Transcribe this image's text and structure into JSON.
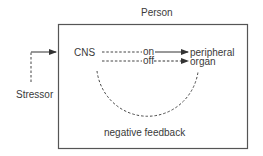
{
  "diagram": {
    "container_label": "Person",
    "input_label": "Stressor",
    "controller_label": "CNS",
    "on_label": "on",
    "off_label": "off",
    "target_label_line1": "peripheral",
    "target_label_line2": "organ",
    "feedback_label": "negative feedback",
    "colors": {
      "line": "#3a3a3a",
      "border": "#555555",
      "background": "#ffffff"
    }
  }
}
